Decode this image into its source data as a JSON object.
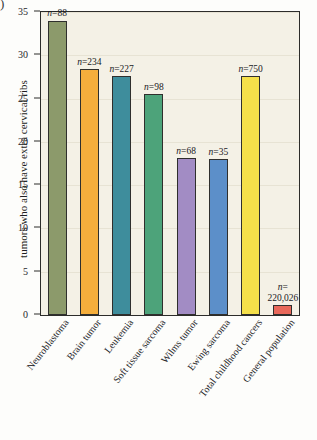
{
  "figure": {
    "corner_glyph": ")",
    "background_color": "#f4f1e6",
    "frame_color": "#2c2c2a"
  },
  "chart_data": {
    "type": "bar",
    "title": "",
    "xlabel": "",
    "ylabel": "tumors who also have extra cervical ribs",
    "ylim": [
      0,
      35
    ],
    "yticks": [
      0,
      5,
      10,
      15,
      20,
      25,
      30,
      35
    ],
    "ytick_labels": [
      "0",
      "5",
      "10",
      "15",
      "20",
      "25",
      "30",
      "35"
    ],
    "grid": true,
    "legend": "none",
    "categories": [
      "Neuroblastoma",
      "Brain tumor",
      "Leukemia",
      "Soft tissue sarcoma",
      "Wilms tumor",
      "Ewing sarcoma",
      "Total childhood cancers",
      "General population"
    ],
    "values": [
      34.0,
      28.4,
      27.6,
      25.5,
      18.1,
      18.0,
      27.6,
      1.1
    ],
    "bar_colors": [
      "#8c9a6b",
      "#f5ae3c",
      "#3e8d9c",
      "#4da37a",
      "#a28cc4",
      "#5c8fc9",
      "#f5e04a",
      "#e8685a"
    ],
    "annotations": [
      "n=88",
      "n=234",
      "n=227",
      "n=98",
      "n=68",
      "n=35",
      "n=750",
      "n=\n220,026"
    ],
    "annotation_values": [
      88,
      234,
      227,
      98,
      68,
      35,
      750,
      220026
    ],
    "annotation_prefix": "n="
  }
}
